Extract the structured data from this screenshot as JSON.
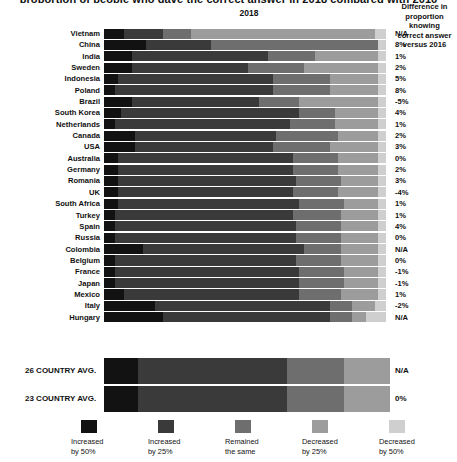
{
  "title_clipped": "proportion of people who gave the correct answer in 2018 compared with 2016",
  "header": {
    "year_label": "2018",
    "diff_line1": "Difference in proportion knowing",
    "diff_line2": "correct answer versus 2016"
  },
  "legend_position": "bottom",
  "colors": {
    "increased_50": "#121212",
    "increased_25": "#3a3a3a",
    "remained_same": "#6e6e6e",
    "decreased_25": "#9c9c9c",
    "decreased_50": "#cfcfcf",
    "background": "#ffffff",
    "text": "#111111"
  },
  "legend": [
    {
      "label_line1": "Increased",
      "label_line2": "by 50%",
      "color": "#121212",
      "key": "increased_50"
    },
    {
      "label_line1": "Increased",
      "label_line2": "by 25%",
      "color": "#3a3a3a",
      "key": "increased_25"
    },
    {
      "label_line1": "Remained",
      "label_line2": "the same",
      "color": "#6e6e6e",
      "key": "remained_same"
    },
    {
      "label_line1": "Decreased",
      "label_line2": "by 25%",
      "color": "#9c9c9c",
      "key": "decreased_25"
    },
    {
      "label_line1": "Decreased",
      "label_line2": "by 50%",
      "color": "#cfcfcf",
      "key": "decreased_50"
    }
  ],
  "chart_data": {
    "type": "bar",
    "subtype": "stacked-horizontal-100",
    "title": "proportion of people who gave the correct answer in 2018 compared with 2016",
    "xlabel": "2018",
    "ylabel": "",
    "xlim": [
      0,
      100
    ],
    "grid": false,
    "legend_entries": [
      "Increased by 50%",
      "Increased by 25%",
      "Remained the same",
      "Decreased by 25%",
      "Decreased by 50%"
    ],
    "annotation_column_header": "Difference in proportion knowing correct answer versus 2016",
    "categories": [
      "Vietnam",
      "China",
      "India",
      "Sweden",
      "Indonesia",
      "Poland",
      "Brazil",
      "South Korea",
      "Netherlands",
      "Canada",
      "USA",
      "Australia",
      "Germany",
      "Romania",
      "UK",
      "South Africa",
      "Turkey",
      "Spain",
      "Russia",
      "Colombia",
      "Belgium",
      "France",
      "Japan",
      "Mexico",
      "Italy",
      "Hungary"
    ],
    "series": [
      {
        "name": "Increased by 50%",
        "color": "#121212",
        "values": [
          7,
          15,
          10,
          10,
          5,
          4,
          10,
          6,
          4,
          11,
          11,
          5,
          5,
          5,
          5,
          5,
          4,
          4,
          4,
          14,
          4,
          4,
          4,
          7,
          18,
          21
        ]
      },
      {
        "name": "Increased by 25%",
        "color": "#3a3a3a",
        "values": [
          14,
          23,
          48,
          41,
          55,
          56,
          45,
          63,
          62,
          50,
          49,
          62,
          62,
          63,
          62,
          64,
          63,
          64,
          64,
          57,
          64,
          65,
          65,
          62,
          62,
          59
        ]
      },
      {
        "name": "Remained the same",
        "color": "#6e6e6e",
        "values": [
          10,
          59,
          17,
          20,
          20,
          20,
          14,
          13,
          16,
          22,
          20,
          16,
          16,
          16,
          16,
          16,
          17,
          16,
          16,
          13,
          16,
          16,
          16,
          15,
          8,
          8
        ]
      },
      {
        "name": "Decreased by 25%",
        "color": "#9c9c9c",
        "values": [
          65,
          0,
          22,
          26,
          17,
          17,
          28,
          15,
          15,
          14,
          17,
          14,
          14,
          13,
          14,
          12,
          13,
          13,
          13,
          13,
          13,
          12,
          12,
          13,
          8,
          5
        ]
      },
      {
        "name": "Decreased by 50%",
        "color": "#cfcfcf",
        "values": [
          4,
          3,
          3,
          3,
          3,
          3,
          3,
          3,
          3,
          3,
          3,
          3,
          3,
          3,
          3,
          3,
          3,
          3,
          3,
          3,
          3,
          3,
          3,
          3,
          4,
          7
        ]
      }
    ],
    "difference_column": [
      "N/A",
      "8%",
      "1%",
      "2%",
      "5%",
      "8%",
      "-5%",
      "4%",
      "1%",
      "2%",
      "3%",
      "0%",
      "2%",
      "3%",
      "-4%",
      "1%",
      "1%",
      "4%",
      "0%",
      "N/A",
      "0%",
      "-1%",
      "-1%",
      "1%",
      "-2%",
      "N/A"
    ],
    "averages": [
      {
        "label": "26 COUNTRY AVG.",
        "difference": "N/A",
        "values": [
          12,
          52,
          20,
          16,
          0
        ]
      },
      {
        "label": "23 COUNTRY AVG.",
        "difference": "0%",
        "values": [
          12,
          52,
          20,
          16,
          0
        ]
      }
    ]
  }
}
